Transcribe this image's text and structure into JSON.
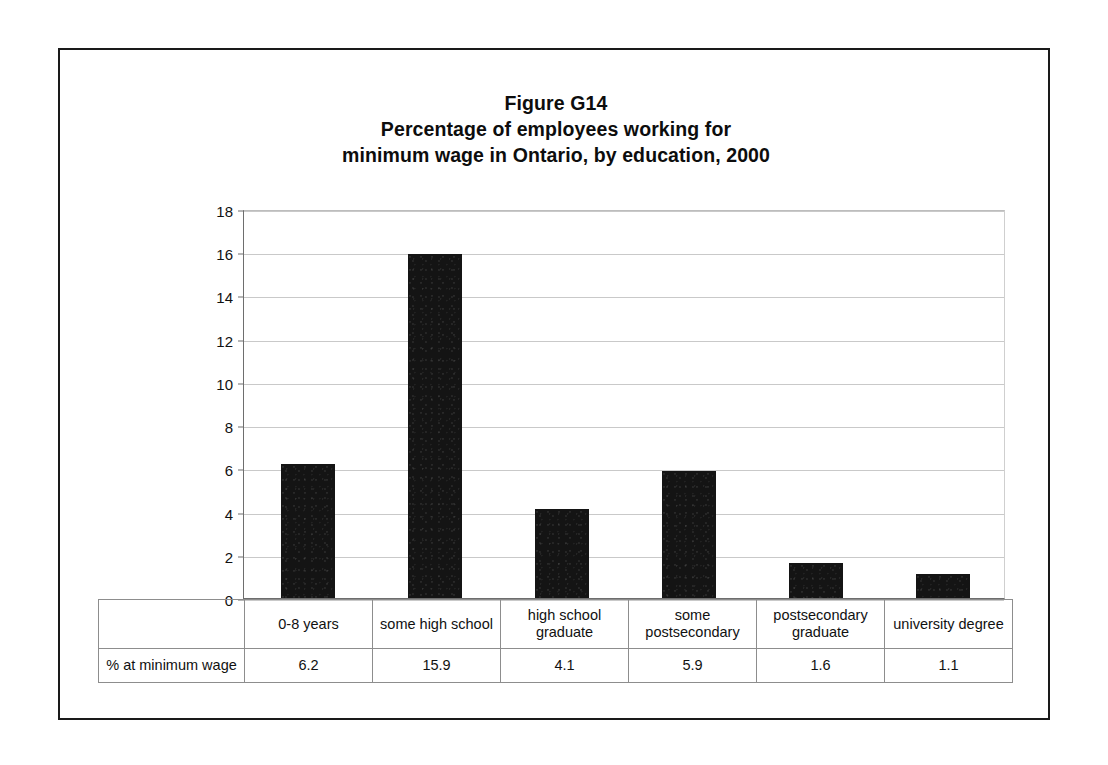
{
  "figure": {
    "title_lines": [
      "Figure G14",
      "Percentage of employees working for",
      "minimum wage in Ontario, by education, 2000"
    ],
    "row_header_label": "% at minimum wage"
  },
  "chart_data": {
    "type": "bar",
    "title": "Figure G14 Percentage of employees working for minimum wage in Ontario, by education, 2000",
    "xlabel": "",
    "ylabel": "",
    "ylim": [
      0,
      18
    ],
    "ytick_values": [
      0,
      2,
      4,
      6,
      8,
      10,
      12,
      14,
      16,
      18
    ],
    "ytick_labels": [
      "0",
      "2",
      "4",
      "6",
      "8",
      "10",
      "12",
      "14",
      "16",
      "18"
    ],
    "grid": true,
    "legend": false,
    "categories": [
      "0-8 years",
      "some high school",
      "high school graduate",
      "some postsecondary",
      "postsecondary graduate",
      "university degree"
    ],
    "category_label_lines": [
      [
        "0-8 years"
      ],
      [
        "some high school"
      ],
      [
        "high school",
        "graduate"
      ],
      [
        "some",
        "postsecondary"
      ],
      [
        "postsecondary",
        "graduate"
      ],
      [
        "university degree"
      ]
    ],
    "series_name": "% at minimum wage",
    "values": [
      6.2,
      15.9,
      4.1,
      5.9,
      1.6,
      1.1
    ],
    "value_labels": [
      "6.2",
      "15.9",
      "4.1",
      "5.9",
      "1.6",
      "1.1"
    ],
    "bar_color": "#141414"
  }
}
